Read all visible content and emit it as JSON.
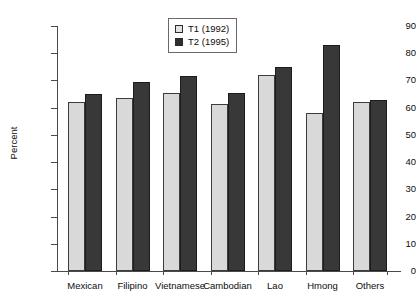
{
  "chart_data": {
    "type": "bar",
    "title": "",
    "xlabel": "",
    "ylabel": "Percent",
    "ylim": [
      0,
      90
    ],
    "yticks": [
      0,
      10,
      20,
      30,
      40,
      50,
      60,
      70,
      80,
      90
    ],
    "grid": false,
    "legend_position": "top-center",
    "categories": [
      "Mexican",
      "Filipino",
      "Vietnamese",
      "Cambodian",
      "Lao",
      "Hmong",
      "Others"
    ],
    "series": [
      {
        "name": "T1 (1992)",
        "color": "#d9d9d9",
        "values": [
          62,
          63.5,
          65.5,
          61.5,
          72,
          58,
          62
        ]
      },
      {
        "name": "T2 (1995)",
        "color": "#383838",
        "values": [
          65,
          69.5,
          71.5,
          65.5,
          75,
          83,
          63
        ]
      }
    ]
  },
  "legend": {
    "items": [
      {
        "label": "T1 (1992)",
        "swatch": "light-square-swatch"
      },
      {
        "label": "T2 (1995)",
        "swatch": "dark-square-swatch"
      }
    ]
  }
}
